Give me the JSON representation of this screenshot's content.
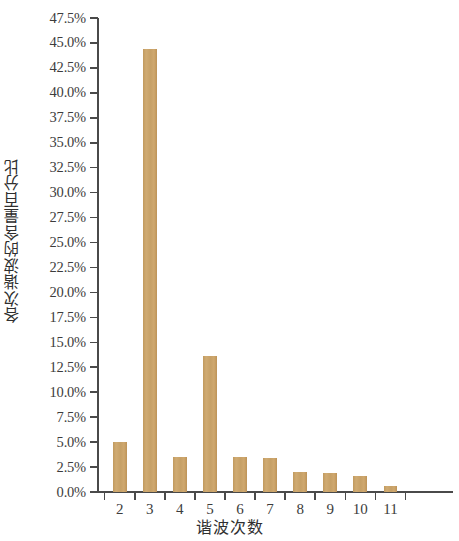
{
  "chart_data": {
    "type": "bar",
    "title": "",
    "xlabel": "谐波次数",
    "ylabel": "各次谐波的含量百分比",
    "categories": [
      "2",
      "3",
      "4",
      "5",
      "6",
      "7",
      "8",
      "9",
      "10",
      "11"
    ],
    "values": [
      5.0,
      44.4,
      3.5,
      13.6,
      3.5,
      3.4,
      2.0,
      1.9,
      1.6,
      0.6
    ],
    "value_labels": [
      "5.0%",
      "44.4%",
      "3.5%",
      "13.6%",
      "3.5%",
      "3.4%",
      "2.0%",
      "1.9%",
      "1.6%",
      "0.6%"
    ],
    "ylim": [
      0,
      47.5
    ],
    "ytick_step": 2.5,
    "yticks": [
      0,
      2.5,
      5,
      7.5,
      10,
      12.5,
      15,
      17.5,
      20,
      22.5,
      25,
      27.5,
      30,
      32.5,
      35,
      37.5,
      40,
      42.5,
      45,
      47.5
    ],
    "ytick_labels": [
      "0.0%",
      "2.5%",
      "5.0%",
      "7.5%",
      "10.0%",
      "12.5%",
      "15.0%",
      "17.5%",
      "20.0%",
      "22.5%",
      "25.0%",
      "27.5%",
      "30.0%",
      "32.5%",
      "35.0%",
      "37.5%",
      "40.0%",
      "42.5%",
      "45.0%",
      "47.5%"
    ],
    "grid": false,
    "legend": false,
    "bar_color": "#c9a063",
    "axis_color": "#4a4a4a",
    "background_color": "#ffffff"
  }
}
